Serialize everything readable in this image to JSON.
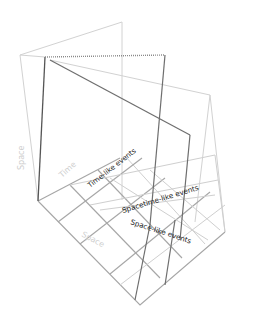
{
  "diagram": {
    "labels": {
      "time_like": "Time-like events",
      "spacetime_like": "Spacetime-like events",
      "space_like": "Space-like events",
      "axis_space_vertical": "Space",
      "axis_time": "Time",
      "axis_space_floor": "Space"
    },
    "colors": {
      "background": "#ffffff",
      "dark_line": "#6e6e6e",
      "faint_line": "#d2d2d2",
      "grid_line": "#a6a6a6",
      "label_text": "#1a1a1a"
    }
  }
}
